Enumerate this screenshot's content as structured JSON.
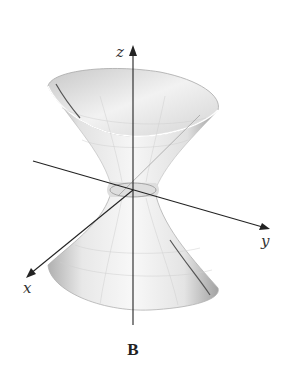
{
  "figure": {
    "caption": "B",
    "axes": {
      "x_label": "x",
      "y_label": "y",
      "z_label": "z"
    },
    "colors": {
      "background": "#ffffff",
      "axis": "#222222",
      "surface_light": "#f4f4f4",
      "surface_dark": "#9a9a9a",
      "rim": "#bdbdbd"
    }
  }
}
